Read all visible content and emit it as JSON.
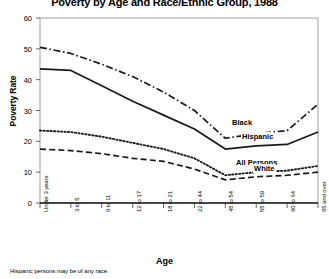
{
  "chart_data": {
    "type": "line",
    "title": "Poverty by Age and Race/Ethnic Group, 1988",
    "xlabel": "Age",
    "ylabel": "Poverty Rate",
    "footnote": "Hispanic persons may be of any race.",
    "categories": [
      "Under 3 years",
      "3 to 5",
      "6 to 11",
      "12 to 17",
      "18 to 21",
      "22 to 44",
      "45 to 54",
      "55 to 59",
      "60 to 64",
      "65 and over"
    ],
    "yticks": [
      0,
      10,
      20,
      30,
      40,
      50,
      60
    ],
    "ylim": [
      0,
      60
    ],
    "grid": false,
    "legend_position": "inline-right",
    "series": [
      {
        "name": "Black",
        "style": "dashdot",
        "values": [
          50.5,
          48.5,
          45.0,
          41.0,
          36.0,
          30.0,
          21.0,
          22.5,
          23.5,
          32.0
        ]
      },
      {
        "name": "Hispanic",
        "style": "solid",
        "values": [
          43.5,
          43.0,
          38.0,
          33.0,
          28.5,
          24.0,
          17.5,
          18.5,
          19.0,
          23.0
        ]
      },
      {
        "name": "All Persons",
        "style": "dotted",
        "values": [
          23.5,
          23.0,
          21.5,
          19.5,
          17.5,
          14.5,
          9.0,
          10.0,
          10.5,
          12.0
        ]
      },
      {
        "name": "White",
        "style": "dashed",
        "values": [
          17.5,
          17.0,
          16.0,
          14.5,
          13.5,
          11.0,
          7.5,
          8.5,
          9.0,
          10.0
        ]
      }
    ]
  },
  "labels": {
    "black": "Black",
    "hispanic": "Hispanic",
    "all_persons": "All Persons",
    "white": "White"
  },
  "colors": {
    "ink": "#1a1a1a",
    "axis": "#555555",
    "background": "#ffffff"
  }
}
